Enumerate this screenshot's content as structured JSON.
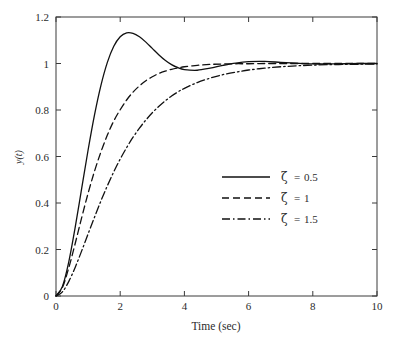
{
  "chart_data": {
    "type": "line",
    "title": "",
    "xlabel": "Time (sec)",
    "ylabel": "y(t)",
    "xlim": [
      0,
      10
    ],
    "ylim": [
      0,
      1.2
    ],
    "grid": false,
    "legend_position": "center-right",
    "xticks": [
      0,
      2,
      4,
      6,
      8,
      10
    ],
    "xticklabels": [
      "0",
      "2",
      "4",
      "6",
      "8",
      "10"
    ],
    "yticks": [
      0,
      0.2,
      0.4,
      0.6,
      0.8,
      1,
      1.2
    ],
    "yticklabels": [
      "0",
      "0.2",
      "0.4",
      "0.6",
      "0.8",
      "1",
      "1.2"
    ],
    "natural_frequency": 1.5,
    "series": [
      {
        "name": "ζ = 0.5",
        "zeta": 0.5,
        "style": "solid",
        "dasharray": "",
        "peak_value": 1.163,
        "peak_time": 1.8,
        "x": [
          0,
          0.2,
          0.4,
          0.6,
          0.8,
          1.0,
          1.2,
          1.4,
          1.6,
          1.8,
          2.0,
          2.2,
          2.4,
          2.6,
          2.8,
          3.0,
          3.2,
          3.4,
          3.6,
          3.8,
          4.0,
          4.4,
          4.8,
          5.2,
          5.6,
          6.0,
          6.5,
          7.0,
          7.5,
          8.0,
          8.5,
          9.0,
          9.5,
          10.0
        ],
        "y": [
          0,
          0.041,
          0.148,
          0.297,
          0.463,
          0.628,
          0.779,
          0.906,
          1.005,
          1.074,
          1.115,
          1.132,
          1.13,
          1.115,
          1.092,
          1.065,
          1.038,
          1.014,
          0.995,
          0.982,
          0.974,
          0.971,
          0.98,
          0.992,
          1.002,
          1.008,
          1.009,
          1.005,
          1.001,
          0.998,
          0.998,
          0.999,
          1.0,
          1.0
        ]
      },
      {
        "name": "ζ = 1",
        "zeta": 1,
        "style": "dashed",
        "dasharray": "7,4",
        "peak_value": 1.0,
        "peak_time": null,
        "x": [
          0,
          0.2,
          0.4,
          0.6,
          0.8,
          1.0,
          1.2,
          1.4,
          1.6,
          1.8,
          2.0,
          2.2,
          2.4,
          2.6,
          2.8,
          3.0,
          3.2,
          3.4,
          3.6,
          3.8,
          4.0,
          4.4,
          4.8,
          5.2,
          5.6,
          6.0,
          6.5,
          7.0,
          7.5,
          8.0,
          8.5,
          9.0,
          9.5,
          10.0
        ],
        "y": [
          0,
          0.037,
          0.122,
          0.227,
          0.337,
          0.442,
          0.537,
          0.62,
          0.692,
          0.753,
          0.801,
          0.843,
          0.877,
          0.904,
          0.926,
          0.943,
          0.957,
          0.967,
          0.975,
          0.981,
          0.986,
          0.992,
          0.996,
          0.998,
          0.999,
          0.999,
          1.0,
          1.0,
          1.0,
          1.0,
          1.0,
          1.0,
          1.0,
          1.0
        ]
      },
      {
        "name": "ζ = 1.5",
        "zeta": 1.5,
        "style": "dashdot",
        "dasharray": "8,3,1.5,3",
        "peak_value": 1.0,
        "peak_time": null,
        "x": [
          0,
          0.2,
          0.4,
          0.6,
          0.8,
          1.0,
          1.2,
          1.4,
          1.6,
          1.8,
          2.0,
          2.2,
          2.4,
          2.6,
          2.8,
          3.0,
          3.2,
          3.4,
          3.6,
          3.8,
          4.0,
          4.4,
          4.8,
          5.2,
          5.6,
          6.0,
          6.5,
          7.0,
          7.5,
          8.0,
          8.5,
          9.0,
          9.5,
          10.0
        ],
        "y": [
          0,
          0.018,
          0.063,
          0.124,
          0.194,
          0.267,
          0.339,
          0.409,
          0.474,
          0.534,
          0.589,
          0.638,
          0.683,
          0.722,
          0.757,
          0.788,
          0.815,
          0.839,
          0.86,
          0.878,
          0.893,
          0.918,
          0.937,
          0.952,
          0.963,
          0.972,
          0.98,
          0.986,
          0.99,
          0.993,
          0.995,
          0.996,
          0.997,
          0.998
        ]
      }
    ]
  },
  "legend": {
    "entries": [
      {
        "symbol": "ζ",
        "equals": "=",
        "value": "0.5",
        "style": "solid"
      },
      {
        "symbol": "ζ",
        "equals": "=",
        "value": "1",
        "style": "dashed"
      },
      {
        "symbol": "ζ",
        "equals": "=",
        "value": "1.5",
        "style": "dashdot"
      }
    ]
  }
}
